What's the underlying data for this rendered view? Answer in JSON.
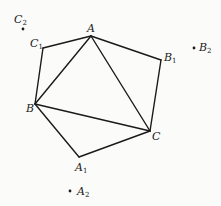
{
  "diagram": {
    "type": "geometry",
    "points": {
      "A": {
        "label": "A",
        "sub": "",
        "x": 91,
        "y": 36
      },
      "B": {
        "label": "B",
        "sub": "",
        "x": 35,
        "y": 104
      },
      "C": {
        "label": "C",
        "sub": "",
        "x": 150,
        "y": 131
      },
      "A1": {
        "label": "A",
        "sub": "1",
        "x": 79,
        "y": 157
      },
      "B1": {
        "label": "B",
        "sub": "1",
        "x": 161,
        "y": 60
      },
      "C1": {
        "label": "C",
        "sub": "1",
        "x": 43,
        "y": 48
      },
      "A2": {
        "label": "A",
        "sub": "2",
        "x": 70,
        "y": 191
      },
      "B2": {
        "label": "B",
        "sub": "2",
        "x": 194,
        "y": 48
      },
      "C2": {
        "label": "C",
        "sub": "2",
        "x": 23,
        "y": 29
      }
    },
    "segments": [
      [
        "A",
        "B"
      ],
      [
        "B",
        "C"
      ],
      [
        "C",
        "A"
      ],
      [
        "A",
        "C1"
      ],
      [
        "C1",
        "B"
      ],
      [
        "A",
        "B1"
      ],
      [
        "B1",
        "C"
      ],
      [
        "B",
        "A1"
      ],
      [
        "A1",
        "C"
      ]
    ],
    "isolated_points": [
      "A2",
      "B2",
      "C2"
    ],
    "line_color": "#1a1a1a"
  }
}
